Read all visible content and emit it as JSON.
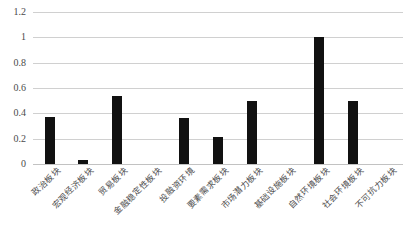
{
  "chart_data": {
    "type": "bar",
    "title": "",
    "xlabel": "",
    "ylabel": "",
    "ylim": [
      0,
      1.2
    ],
    "grid": true,
    "legend": false,
    "bar_color": "#111111",
    "gridline_color": "#d0d0d0",
    "yticks": [
      "0",
      "0.2",
      "0.4",
      "0.6",
      "0.8",
      "1",
      "1.2"
    ],
    "ytick_values": [
      0,
      0.2,
      0.4,
      0.6,
      0.8,
      1,
      1.2
    ],
    "categories": [
      "政治板块",
      "宏观经济板块",
      "贸易板块",
      "金融稳定性板块",
      "投融资环境",
      "要素需求板块",
      "市场潜力板块",
      "基础设施板块",
      "自然环境板块",
      "社会环境板块",
      "不可抗力板块"
    ],
    "values": [
      0.375,
      0.03,
      0.54,
      0,
      0.36,
      0.21,
      0.5,
      0,
      1.0,
      0.5,
      0
    ]
  }
}
